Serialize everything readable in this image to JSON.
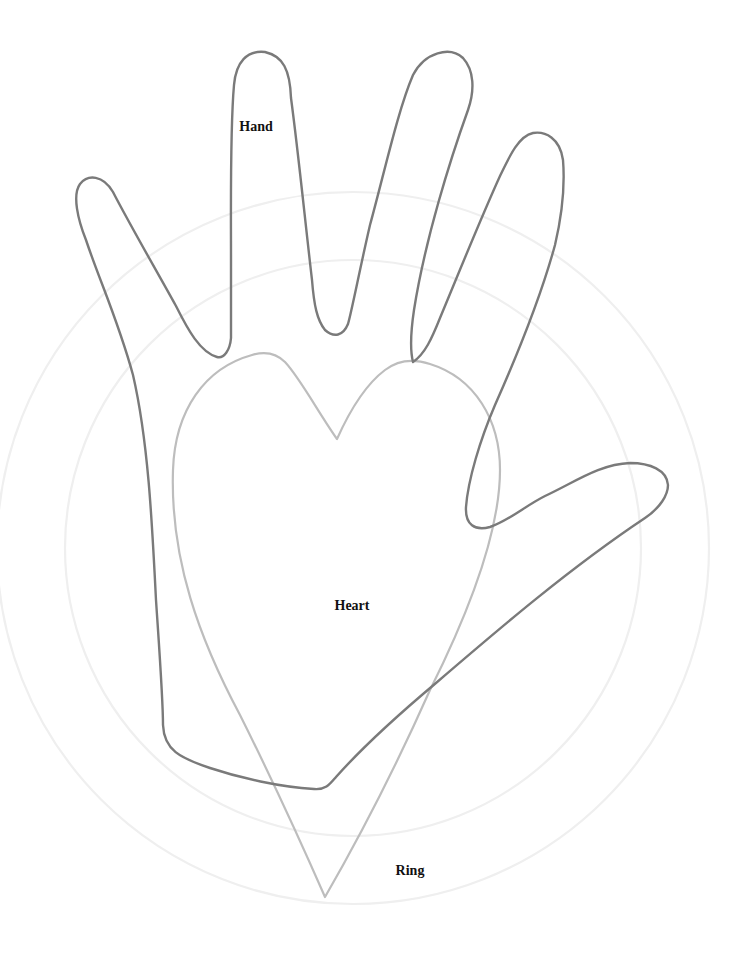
{
  "diagram": {
    "title": "",
    "colors": {
      "background": "#ffffff",
      "hand_stroke": "#7a7a7a",
      "heart_stroke": "#bdbdbd",
      "ring_stroke": "#efefef",
      "label_text": "#111111"
    },
    "rings": [
      {
        "name": "outer-ring",
        "cx": 353,
        "cy": 548,
        "r": 356
      },
      {
        "name": "inner-ring",
        "cx": 353,
        "cy": 548,
        "r": 288
      }
    ],
    "shapes": {
      "hand": {
        "label": "Hand",
        "label_pos": {
          "x": 256,
          "y": 127
        },
        "path": "M 217 357 C 200 352, 188 330, 176 306 C 155 268, 130 225, 113 192 C 103 175, 88 174, 80 184 C 72 195, 78 220, 86 240 C 100 282, 118 320, 133 375 C 148 440, 152 520, 156 600 C 160 660, 163 700, 163 725 C 164 750, 180 758, 210 768 C 240 778, 280 787, 314 789 C 326 790, 330 784, 336 777 C 360 750, 392 720, 436 683 C 500 628, 570 568, 645 518 C 660 508, 668 495, 668 485 C 667 470, 650 463, 630 463 C 600 464, 575 482, 545 496 C 525 506, 510 520, 490 527 C 475 531, 465 525, 466 507 C 468 480, 480 440, 495 405 C 515 360, 540 300, 555 245 C 562 215, 565 185, 563 160 C 560 138, 545 131, 533 133 C 519 136, 510 155, 500 176 C 480 220, 460 270, 440 318 C 432 338, 425 354, 413 362 C 410 350, 411 330, 414 310 C 425 240, 450 160, 468 110 C 475 90, 474 70, 463 58 C 450 46, 425 52, 413 75 C 398 110, 385 170, 370 225 C 360 268, 352 310, 348 324 C 343 336, 334 338, 325 330 C 317 320, 314 305, 312 280 C 305 220, 298 150, 291 98 C 290 70, 283 56, 265 52 C 247 50, 236 62, 234 85 C 230 130, 231 200, 231 260 C 231 300, 231 320, 231 338 C 230 350, 224 359, 217 357 Z"
      },
      "heart": {
        "label": "Heart",
        "label_pos": {
          "x": 352,
          "y": 606
        },
        "path": "M 337 439 C 318 412, 300 378, 285 362 C 275 352, 262 352, 252 355 C 205 368, 175 410, 173 470 C 170 560, 200 640, 240 715 C 270 775, 300 840, 325 897 C 355 845, 390 780, 430 690 C 470 610, 500 530, 500 470 C 500 420, 475 378, 430 364 C 412 358, 398 360, 385 370 C 365 385, 350 410, 337 439 Z"
      },
      "ring": {
        "label": "Ring",
        "label_pos": {
          "x": 410,
          "y": 871
        }
      }
    }
  }
}
